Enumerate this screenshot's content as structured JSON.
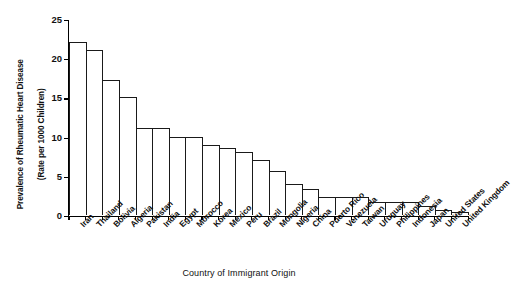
{
  "chart_data": {
    "type": "bar",
    "title": "",
    "xlabel": "Country of Immigrant Origin",
    "ylabel": "Prevalence of Rheumatic Heart Disease\n(Rate per 1000 Children)",
    "ylabel_line1": "Prevalence of Rheumatic Heart Disease",
    "ylabel_line2": "(Rate per 1000 Children)",
    "ylim": [
      0,
      25
    ],
    "yticks": [
      0,
      5,
      10,
      15,
      20,
      25
    ],
    "ytick_labels": [
      "0",
      "5",
      "10",
      "15",
      "20",
      "25"
    ],
    "grid": false,
    "legend": "none",
    "categories": [
      "Iran",
      "Thailand",
      "Bolivia",
      "Algeria",
      "Pakistan",
      "India",
      "Egypt",
      "Morocco",
      "Korea",
      "Mexico",
      "Peru",
      "Brazil",
      "Mongolia",
      "Nigeria",
      "China",
      "Puerto Rico",
      "Venezuela",
      "Taiwan",
      "Uruguay",
      "Philippines",
      "Indonesia",
      "Japan",
      "United States",
      "United Kingdom"
    ],
    "values": [
      22.1,
      21.1,
      17.2,
      15.1,
      11.1,
      11.1,
      10.0,
      10.0,
      8.9,
      8.6,
      8.0,
      7.0,
      5.6,
      3.9,
      3.3,
      2.3,
      2.3,
      2.3,
      1.6,
      1.6,
      1.6,
      1.2,
      0.6,
      0.4
    ]
  },
  "watermark": {
    "line1": "SAMPLE",
    "line2": "SCANNED FIGURE"
  }
}
